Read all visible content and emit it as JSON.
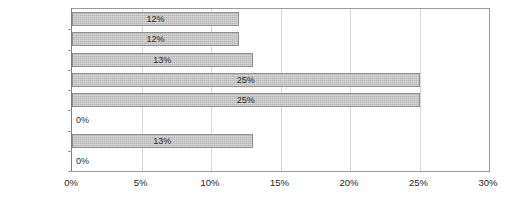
{
  "chart_data": {
    "type": "bar",
    "orientation": "horizontal",
    "title": "",
    "subtitle": "",
    "xlabel": "",
    "ylabel": "",
    "categories": [
      "Hamina",
      "Iitti",
      "Kotka",
      "Kouvola",
      "Miehikkälä",
      "Pyhtää",
      "Virolahti",
      "Other"
    ],
    "values": [
      12,
      12,
      13,
      25,
      25,
      0,
      13,
      0
    ],
    "data_labels": [
      "12%",
      "12%",
      "13%",
      "25%",
      "25%",
      "0%",
      "13%",
      "0%"
    ],
    "xlim": [
      0,
      30
    ],
    "xticks": [
      0,
      5,
      10,
      15,
      20,
      25,
      30
    ],
    "xtick_labels": [
      "0%",
      "5%",
      "10%",
      "15%",
      "20%",
      "25%",
      "30%"
    ],
    "grid": true,
    "grid_axis": "x",
    "legend": false,
    "legend_position": "none",
    "series": [
      {
        "name": "",
        "values": [
          12,
          12,
          13,
          25,
          25,
          0,
          13,
          0
        ]
      }
    ]
  },
  "style": {
    "bar_fill": "#b6b6b6",
    "bar_border": "#8f8f8f",
    "grid_color": "#d6d6d6",
    "axis_color": "#9a9a9a",
    "text_color": "#1f1f1f",
    "background": "#ffffff"
  }
}
